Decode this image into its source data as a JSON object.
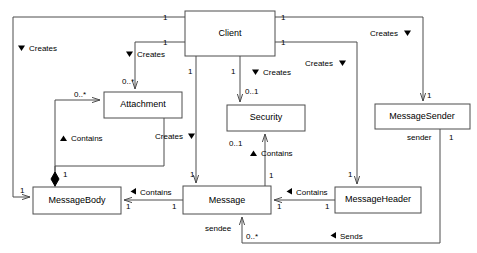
{
  "diagram": {
    "type": "uml-class-diagram",
    "background": "#ffffff",
    "line_color": "#4d4d4d",
    "text_color": "#000000"
  },
  "classes": [
    {
      "id": "client",
      "name": "Client",
      "x": 185,
      "y": 11,
      "w": 90,
      "h": 45
    },
    {
      "id": "attachment",
      "name": "Attachment",
      "x": 104,
      "y": 92,
      "w": 78,
      "h": 26
    },
    {
      "id": "security",
      "name": "Security",
      "x": 227,
      "y": 105,
      "w": 78,
      "h": 26
    },
    {
      "id": "messagesender",
      "name": "MessageSender",
      "x": 375,
      "y": 104,
      "w": 95,
      "h": 25
    },
    {
      "id": "messagebody",
      "name": "MessageBody",
      "x": 33,
      "y": 187,
      "w": 88,
      "h": 27
    },
    {
      "id": "message",
      "name": "Message",
      "x": 183,
      "y": 186,
      "w": 88,
      "h": 28
    },
    {
      "id": "messageheader",
      "name": "MessageHeader",
      "x": 335,
      "y": 187,
      "w": 86,
      "h": 26
    }
  ],
  "association_labels": [
    {
      "id": "creates-messagebody",
      "text": "Creates",
      "marker": "down-left",
      "x": 18,
      "y": 49
    },
    {
      "id": "creates-attachment",
      "text": "Creates",
      "marker": "down-left",
      "x": 126,
      "y": 55
    },
    {
      "id": "creates-messagesender",
      "text": "Creates",
      "marker": "down-right",
      "x": 372,
      "y": 36
    },
    {
      "id": "creates-messageheader",
      "text": "Creates",
      "marker": "down-right",
      "x": 307,
      "y": 66
    },
    {
      "id": "creates-security",
      "text": "Creates",
      "marker": "down-left",
      "x": 252,
      "y": 75
    },
    {
      "id": "creates-message",
      "text": "Creates",
      "marker": "down-right",
      "x": 155,
      "y": 139
    },
    {
      "id": "contains-messagebody-attachment",
      "text": "Contains",
      "marker": "up-left",
      "x": 60,
      "y": 140
    },
    {
      "id": "contains-message-security",
      "text": "Contains",
      "marker": "up-left",
      "x": 250,
      "y": 155
    },
    {
      "id": "contains-messagebody-message",
      "text": "Contains",
      "marker": "left",
      "x": 130,
      "y": 191
    },
    {
      "id": "contains-message-messageheader",
      "text": "Contains",
      "marker": "left",
      "x": 286,
      "y": 191
    },
    {
      "id": "sends-messagesender-message",
      "text": "Sends",
      "marker": "left",
      "x": 330,
      "y": 235
    }
  ],
  "multiplicities": [
    {
      "id": "m-client-left-top",
      "text": "1",
      "x": 163,
      "y": 20
    },
    {
      "id": "m-client-left-bottom",
      "text": "1",
      "x": 163,
      "y": 45
    },
    {
      "id": "m-client-right-top",
      "text": "1",
      "x": 281,
      "y": 20
    },
    {
      "id": "m-client-right-bottom",
      "text": "1",
      "x": 281,
      "y": 45
    },
    {
      "id": "m-client-down-body",
      "text": "1",
      "x": 190,
      "y": 74
    },
    {
      "id": "m-client-down-security",
      "text": "1",
      "x": 231,
      "y": 74
    },
    {
      "id": "m-attachment-top",
      "text": "0..*",
      "x": 122,
      "y": 84
    },
    {
      "id": "m-attachment-left",
      "text": "0..*",
      "x": 74,
      "y": 97
    },
    {
      "id": "m-security-top",
      "text": "0..1",
      "x": 245,
      "y": 94
    },
    {
      "id": "m-messagesender-top",
      "text": "1",
      "x": 427,
      "y": 98
    },
    {
      "id": "m-security-bottom",
      "text": "0..1",
      "x": 229,
      "y": 146
    },
    {
      "id": "m-message-top-security",
      "text": "1",
      "x": 270,
      "y": 178
    },
    {
      "id": "m-messagebody-diamond",
      "text": "1",
      "x": 63,
      "y": 176
    },
    {
      "id": "m-message-top-creates",
      "text": "1",
      "x": 194,
      "y": 176
    },
    {
      "id": "m-messageheader-top",
      "text": "1",
      "x": 346,
      "y": 176
    },
    {
      "id": "m-messagebody-left",
      "text": "1",
      "x": 20,
      "y": 191
    },
    {
      "id": "m-messagebody-right",
      "text": "1",
      "x": 126,
      "y": 207
    },
    {
      "id": "m-message-left",
      "text": "1",
      "x": 172,
      "y": 207
    },
    {
      "id": "m-message-right",
      "text": "1",
      "x": 277,
      "y": 207
    },
    {
      "id": "m-messageheader-left",
      "text": "1",
      "x": 325,
      "y": 207
    },
    {
      "id": "m-message-bottom-sendee",
      "text": "0..*",
      "x": 250,
      "y": 235
    },
    {
      "id": "m-messagesender-bottom",
      "text": "1",
      "x": 452,
      "y": 139
    }
  ],
  "roles": [
    {
      "id": "role-sender",
      "text": "sender",
      "x": 407,
      "y": 139
    },
    {
      "id": "role-sendee",
      "text": "sendee",
      "x": 208,
      "y": 230
    }
  ]
}
